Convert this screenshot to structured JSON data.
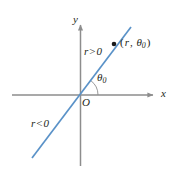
{
  "figure": {
    "background_color": "#ffffff",
    "width": 171,
    "height": 176
  },
  "colors": {
    "axis": "#8d8d8d",
    "line": "#5a92c8",
    "text": "#231f20",
    "point": "#1a1a1a",
    "arc": "#8d8d8d"
  },
  "axes": {
    "x_axis": {
      "label": "x",
      "name": "x-axis",
      "start": [
        12,
        95
      ],
      "end": [
        158,
        95
      ],
      "arrow": "right"
    },
    "y_axis": {
      "label": "y",
      "name": "y-axis",
      "start": [
        80,
        166
      ],
      "end": [
        80,
        20
      ],
      "arrow": "up"
    },
    "origin_label": "O"
  },
  "ray": {
    "name": "polar-line",
    "start": [
      32,
      158
    ],
    "end": [
      131,
      27
    ],
    "color": "#5a92c8"
  },
  "annotations": {
    "r_positive": {
      "text": "r > 0",
      "r": "r",
      "relation": ">",
      "value": "0"
    },
    "r_negative": {
      "text": "r < 0",
      "r": "r",
      "relation": "<",
      "value": "0"
    },
    "theta": {
      "symbol": "θ",
      "subscript": "0",
      "text": "θ₀"
    },
    "point_label": {
      "open": "(",
      "r": "r",
      "comma": ",",
      "theta": "θ",
      "subscript": "0",
      "close": ")",
      "text": "(r, θ₀)"
    }
  },
  "point": {
    "name": "plotted-point",
    "position": [
      114,
      44
    ],
    "radius": 2.2
  },
  "angle_arc": {
    "center": [
      80,
      95
    ],
    "radius": 18,
    "start_angle_deg": 0,
    "end_angle_deg": 53
  }
}
